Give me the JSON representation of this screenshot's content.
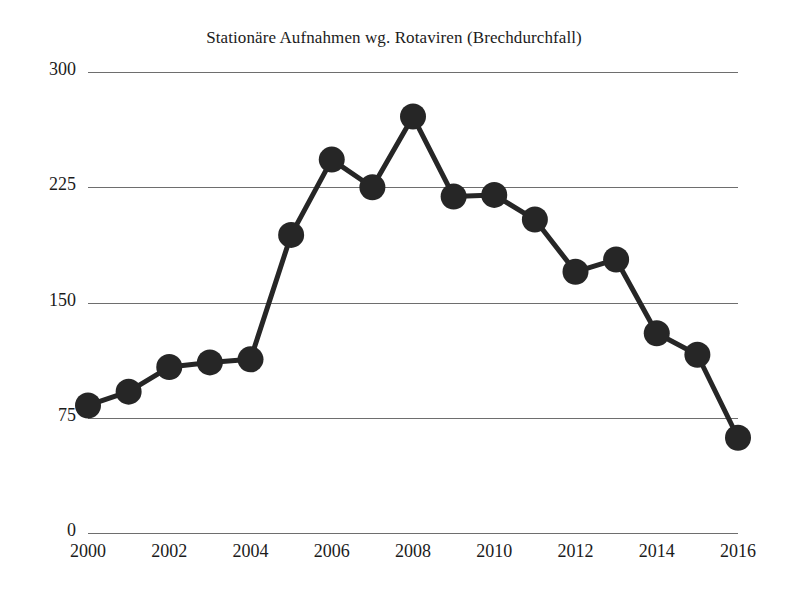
{
  "chart_data": {
    "type": "line",
    "title": "Stationäre Aufnahmen wg. Rotaviren (Brechdurchfall)",
    "subtitle": "",
    "xlabel": "",
    "ylabel": "",
    "x": [
      2000,
      2001,
      2002,
      2003,
      2004,
      2005,
      2006,
      2007,
      2008,
      2009,
      2010,
      2011,
      2012,
      2013,
      2014,
      2015,
      2016
    ],
    "values": [
      83,
      92,
      108,
      111,
      113,
      194,
      243,
      225,
      271,
      219,
      220,
      204,
      170,
      178,
      130,
      116,
      62
    ],
    "series": [
      {
        "name": "Stationäre Aufnahmen wg. Rotaviren",
        "values": [
          83,
          92,
          108,
          111,
          113,
          194,
          243,
          225,
          271,
          219,
          220,
          204,
          170,
          178,
          130,
          116,
          62
        ]
      }
    ],
    "xlim": [
      2000,
      2016
    ],
    "ylim": [
      0,
      300
    ],
    "xticks": [
      "2000",
      "2002",
      "2004",
      "2006",
      "2008",
      "2010",
      "2012",
      "2014",
      "2016"
    ],
    "xtick_values": [
      2000,
      2002,
      2004,
      2006,
      2008,
      2010,
      2012,
      2014,
      2016
    ],
    "yticks": [
      "300",
      "225",
      "150",
      "75",
      "0"
    ],
    "ytick_values": [
      300,
      225,
      150,
      75,
      0
    ],
    "grid": "horizontal",
    "legend": "none",
    "marker": "circle",
    "marker_color": "#262626",
    "line_color": "#262626",
    "grid_color": "#6e6e6e",
    "background": "#ffffff"
  }
}
